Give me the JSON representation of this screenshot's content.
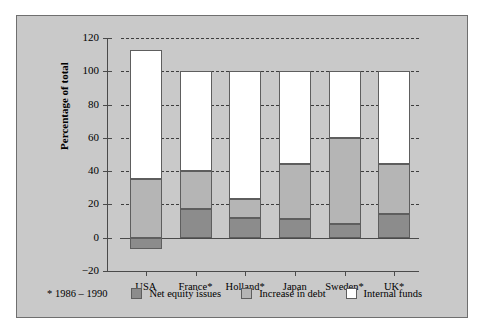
{
  "footnote": "* 1986 – 1990",
  "axis": {
    "ylabel": "Percentage of total",
    "yticks": [
      "120",
      "100",
      "80",
      "60",
      "40",
      "20",
      "0",
      "−20"
    ]
  },
  "legend": [
    {
      "name": "legend-net-equity-issues",
      "label": "Net equity issues",
      "color": "#8c8c8c"
    },
    {
      "name": "legend-increase-in-debt",
      "label": "Increase in debt",
      "color": "#b5b5b5"
    },
    {
      "name": "legend-internal-funds",
      "label": "Internal funds",
      "color": "#ffffff"
    }
  ],
  "chart_data": {
    "type": "bar",
    "subtype": "stacked",
    "title": "",
    "xlabel": "",
    "ylabel": "Percentage of total",
    "ylim": [
      -20,
      120
    ],
    "ytick_step": 20,
    "grid": "horizontal-dashed",
    "legend_position": "bottom",
    "categories": [
      "USA",
      "France*",
      "Holland*",
      "Japan",
      "Sweden*",
      "UK*"
    ],
    "series": [
      {
        "name": "Net equity issues",
        "color": "#8c8c8c",
        "values": [
          -7,
          17,
          12,
          11,
          8,
          14
        ]
      },
      {
        "name": "Increase in debt",
        "color": "#b5b5b5",
        "values": [
          35,
          23,
          11,
          33,
          52,
          30
        ]
      },
      {
        "name": "Internal funds",
        "color": "#ffffff",
        "values": [
          78,
          60,
          77,
          56,
          40,
          56
        ]
      }
    ],
    "totals": [
      106,
      100,
      100,
      100,
      100,
      100
    ]
  }
}
